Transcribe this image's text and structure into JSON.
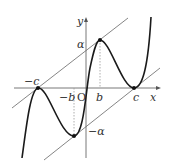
{
  "diagram": {
    "type": "function-graph",
    "axes": {
      "x_label": "x",
      "y_label": "y",
      "origin_label": "O"
    },
    "x_tick_labels": {
      "neg_c": "−c",
      "neg_b": "−b",
      "b": "b",
      "c": "c"
    },
    "y_tick_labels": {
      "alpha": "α",
      "neg_alpha": "−α"
    },
    "curve": "cubic-like quintic through (−c,0) max, (−b,−α) min, (b,α) max, (c,0) min",
    "tangent_lines": [
      "upper line through (−c,0) and (b,α)",
      "lower line through (−b,−α) and (c,0)"
    ],
    "marked_points": [
      "(−c,0)",
      "(−b,−α)",
      "(b,α)",
      "(c,0)"
    ],
    "colors": {
      "curve": "#1a1a1a",
      "lines": "#555555",
      "axes": "#555555",
      "dotted": "#999999"
    }
  }
}
